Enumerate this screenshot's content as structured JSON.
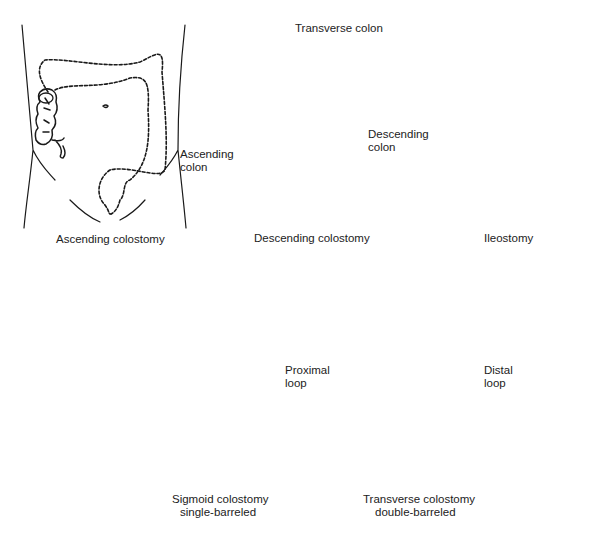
{
  "panels": [
    {
      "id": "ascending",
      "caption": "Ascending colostomy"
    },
    {
      "id": "descending",
      "caption": "Descending colostomy",
      "labels": {
        "transverse": "Transverse colon",
        "ascending_1": "Ascending",
        "ascending_2": "colon",
        "descending_1": "Descending",
        "descending_2": "colon"
      }
    },
    {
      "id": "ileostomy",
      "caption": "Ileostomy"
    },
    {
      "id": "sigmoid",
      "caption_1": "Sigmoid colostomy",
      "caption_2": "single-barreled"
    },
    {
      "id": "transverse",
      "caption_1": "Transverse colostomy",
      "caption_2": "double-barreled",
      "labels": {
        "proximal_1": "Proximal",
        "proximal_2": "loop",
        "distal_1": "Distal",
        "distal_2": "loop"
      }
    }
  ],
  "colors": {
    "line": "#1a1a1a",
    "background": "#ffffff"
  }
}
